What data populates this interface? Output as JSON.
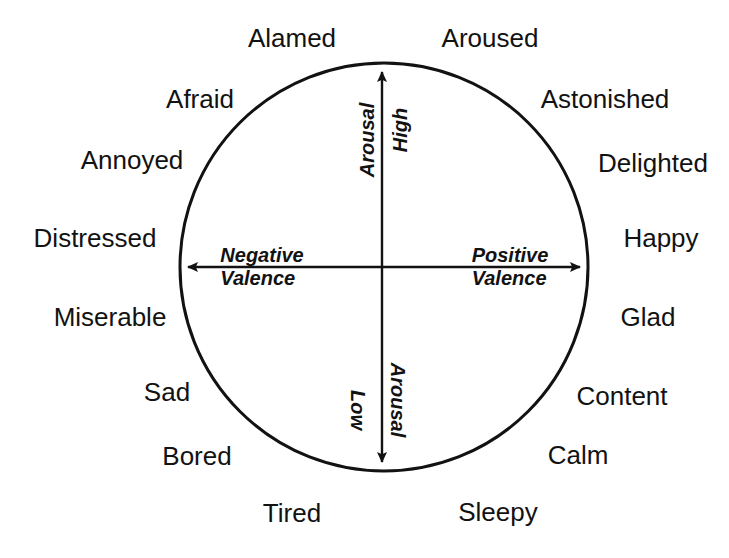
{
  "figure": {
    "type": "circumplex-model-of-affect",
    "background_color": "#ffffff",
    "ink_color": "#121212",
    "circle": {
      "cx": 384,
      "cy": 267,
      "r": 204,
      "stroke_width": 3
    },
    "axes": {
      "horizontal": {
        "x1": 178,
        "x2": 590,
        "y": 267,
        "arrows": "both"
      },
      "vertical": {
        "y1": 62,
        "y2": 472,
        "x": 382,
        "arrows": "both"
      }
    }
  },
  "axis_labels": {
    "left": {
      "line1": "Negative",
      "line2": "Valence",
      "x": 262,
      "y": 267
    },
    "right": {
      "line1": "Positive",
      "line2": "Valence",
      "x": 510,
      "y": 267
    },
    "top_inner": {
      "text": "High",
      "x": 400,
      "y": 130
    },
    "top_outer": {
      "text": "Arousal",
      "x": 367,
      "y": 140
    },
    "bottom_inner": {
      "text": "Low",
      "x": 358,
      "y": 410
    },
    "bottom_outer": {
      "text": "Arousal",
      "x": 398,
      "y": 400
    }
  },
  "emotions": [
    {
      "name": "Alamed",
      "x": 292,
      "y": 38
    },
    {
      "name": "Aroused",
      "x": 490,
      "y": 38
    },
    {
      "name": "Afraid",
      "x": 200,
      "y": 99
    },
    {
      "name": "Astonished",
      "x": 605,
      "y": 99
    },
    {
      "name": "Annoyed",
      "x": 132,
      "y": 160
    },
    {
      "name": "Delighted",
      "x": 653,
      "y": 163
    },
    {
      "name": "Distressed",
      "x": 95,
      "y": 238
    },
    {
      "name": "Happy",
      "x": 661,
      "y": 238
    },
    {
      "name": "Miserable",
      "x": 110,
      "y": 317
    },
    {
      "name": "Glad",
      "x": 648,
      "y": 317
    },
    {
      "name": "Sad",
      "x": 167,
      "y": 392
    },
    {
      "name": "Content",
      "x": 622,
      "y": 396
    },
    {
      "name": "Bored",
      "x": 197,
      "y": 456
    },
    {
      "name": "Calm",
      "x": 578,
      "y": 455
    },
    {
      "name": "Tired",
      "x": 292,
      "y": 513
    },
    {
      "name": "Sleepy",
      "x": 498,
      "y": 512
    }
  ],
  "chart_data": {
    "type": "scatter",
    "xlabel": "Valence",
    "ylabel": "Arousal",
    "xlim": [
      -1,
      1
    ],
    "ylim": [
      -1,
      1
    ],
    "grid": false,
    "legend": "none",
    "annotations": [
      "Negative Valence",
      "Positive Valence",
      "High Arousal",
      "Low Arousal"
    ],
    "categories": [
      "Alamed",
      "Aroused",
      "Afraid",
      "Astonished",
      "Annoyed",
      "Delighted",
      "Distressed",
      "Happy",
      "Miserable",
      "Glad",
      "Sad",
      "Content",
      "Bored",
      "Calm",
      "Tired",
      "Sleepy"
    ]
  }
}
